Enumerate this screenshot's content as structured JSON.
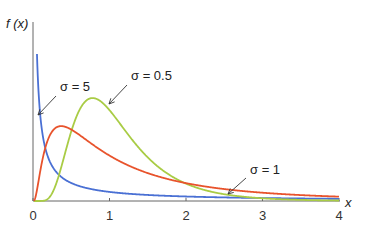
{
  "chart_data": {
    "type": "line",
    "title": "",
    "xlabel": "x",
    "ylabel": "f (x)",
    "xlim": [
      0,
      4
    ],
    "ylim": [
      0,
      1.37
    ],
    "x_ticks": [
      "0",
      "1",
      "2",
      "3",
      "4"
    ],
    "grid": false,
    "distribution": "lognormal, mu = 0",
    "series": [
      {
        "name": "σ = 5",
        "sigma": 5,
        "color": "#4a70d4"
      },
      {
        "name": "σ = 0.5",
        "sigma": 0.5,
        "color": "#a9cc45"
      },
      {
        "name": "σ = 1",
        "sigma": 1,
        "color": "#e8532c"
      }
    ],
    "annotations": [
      {
        "text": "σ = 5",
        "series": 0
      },
      {
        "text": "σ = 0.5",
        "series": 1
      },
      {
        "text": "σ = 1",
        "series": 2
      }
    ]
  }
}
